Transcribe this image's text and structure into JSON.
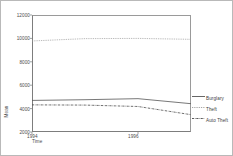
{
  "chart_data": {
    "type": "line",
    "title": "",
    "xlabel": "Time",
    "ylabel": "Mean",
    "x": [
      1994,
      1995,
      1996,
      1997
    ],
    "xtick_labels": [
      "1994",
      "1996"
    ],
    "ytick_labels": [
      "12000",
      "10000",
      "8000",
      "6000",
      "4000",
      "2000"
    ],
    "ylim": [
      2000,
      12000
    ],
    "grid": false,
    "legend_position": "right",
    "series": [
      {
        "name": "Burglary",
        "style": "solid",
        "color": "#555555",
        "values": [
          4700,
          4760,
          4850,
          4420
        ]
      },
      {
        "name": "Theft",
        "style": "dotted",
        "color": "#9a9a9a",
        "values": [
          9780,
          9980,
          10000,
          9920
        ]
      },
      {
        "name": "Auto Theft",
        "style": "dash-dot",
        "color": "#4a4a4a",
        "values": [
          4320,
          4300,
          4180,
          3480
        ]
      }
    ]
  },
  "legend": {
    "items": [
      {
        "label": "Burglary"
      },
      {
        "label": "Theft"
      },
      {
        "label": "Auto Theft"
      }
    ]
  },
  "axes": {
    "y_title": "Mean",
    "x_title": "Time"
  }
}
